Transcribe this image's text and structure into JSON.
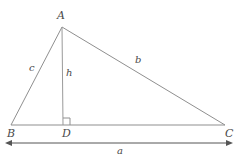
{
  "figure": {
    "shape": "triangle",
    "stroke_color": "#8a8a8a",
    "label_color": "#4a4a4a",
    "background_color": "#ffffff"
  },
  "vertices": {
    "A": {
      "label": "A",
      "x": 62,
      "y": 27
    },
    "B": {
      "label": "B",
      "x": 11,
      "y": 125
    },
    "C": {
      "label": "C",
      "x": 225,
      "y": 125
    },
    "D": {
      "label": "D",
      "x": 63,
      "y": 125
    }
  },
  "sides": {
    "c": {
      "label": "c",
      "from": "B",
      "to": "A"
    },
    "b": {
      "label": "b",
      "from": "A",
      "to": "C"
    },
    "h": {
      "label": "h",
      "from": "A",
      "to": "D"
    },
    "a": {
      "label": "a",
      "from": "B",
      "to": "C"
    }
  },
  "markers": {
    "right_angle": {
      "name": "right-angle-marker",
      "at": "D",
      "size": 7
    }
  },
  "dimension": {
    "name": "base-dimension-a",
    "label": "a",
    "x1": 11,
    "x2": 227,
    "y": 143,
    "arrowheads": "both"
  }
}
